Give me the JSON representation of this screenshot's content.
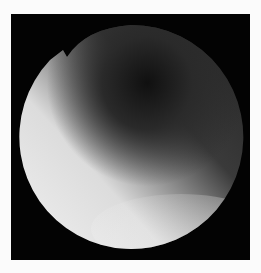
{
  "image": {
    "description": "Grayscale circular scope/endoscopic-style image on black square background",
    "colors": {
      "page_background": "#fbfbfb",
      "frame_background": "#030303",
      "bright_region": "#e6e6e6",
      "mid_region": "#8a8a8a",
      "dark_region": "#151515"
    }
  }
}
